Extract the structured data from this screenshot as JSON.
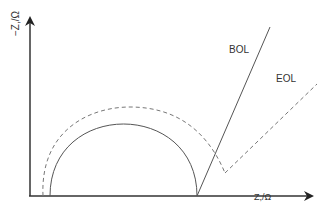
{
  "diagram": {
    "type": "nyquist-impedance-plot",
    "x_axis_label": "Z,/Ω",
    "y_axis_label": "−Z,/Ω",
    "series": [
      {
        "name": "BOL",
        "label": "BOL",
        "style": "solid",
        "color": "#555555"
      },
      {
        "name": "EOL",
        "label": "EOL",
        "style": "dashed",
        "color": "#777777"
      }
    ],
    "colors": {
      "axis": "#333333",
      "solid": "#555555",
      "dashed": "#777777"
    }
  }
}
